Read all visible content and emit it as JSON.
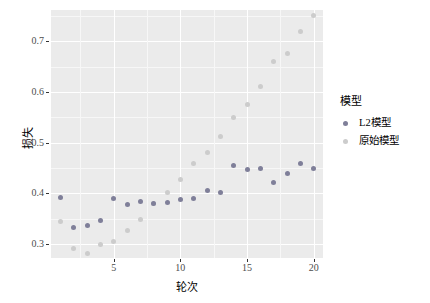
{
  "chart_data": {
    "type": "scatter",
    "title": "",
    "xlabel": "轮次",
    "ylabel": "损失",
    "xlim": [
      0.3,
      20.7
    ],
    "ylim": [
      0.272,
      0.762
    ],
    "xticks": [
      5,
      10,
      15,
      20
    ],
    "yticks": [
      "0.3",
      "0.4",
      "0.5",
      "0.6",
      "0.7"
    ],
    "ytick_values": [
      0.3,
      0.4,
      0.5,
      0.6,
      0.7
    ],
    "grid": true,
    "legend_position": "right",
    "legend_title": "模型",
    "x": [
      1,
      2,
      3,
      4,
      5,
      6,
      7,
      8,
      9,
      10,
      11,
      12,
      13,
      14,
      15,
      16,
      17,
      18,
      19,
      20
    ],
    "series": [
      {
        "name": "L2模型",
        "color": "#7f7f99",
        "values": [
          0.391,
          0.333,
          0.337,
          0.346,
          0.39,
          0.377,
          0.383,
          0.379,
          0.382,
          0.388,
          0.389,
          0.405,
          0.402,
          0.454,
          0.446,
          0.448,
          0.421,
          0.44,
          0.458,
          0.448
        ]
      },
      {
        "name": "原始模型",
        "color": "#cccccc",
        "values": [
          0.344,
          0.29,
          0.281,
          0.299,
          0.304,
          0.326,
          0.348,
          0.379,
          0.402,
          0.427,
          0.458,
          0.481,
          0.512,
          0.549,
          0.575,
          0.611,
          0.66,
          0.677,
          0.719,
          0.752
        ]
      }
    ]
  },
  "panel": {
    "background": "#ebebeb",
    "gridline_color": "#ffffff",
    "minor_gridline_color": "#f7f7f7"
  },
  "axis": {
    "tick_label_color": "#4d4d4d",
    "tick_mark_color": "#333333"
  }
}
